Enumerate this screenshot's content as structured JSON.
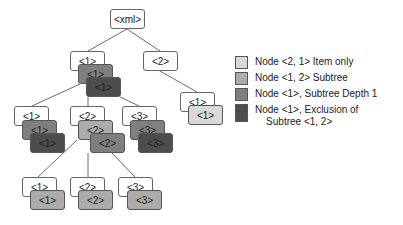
{
  "diagram": {
    "root": {
      "label": "<xml>"
    },
    "level1": [
      {
        "label": "<1>"
      },
      {
        "label": "<2>"
      }
    ],
    "level1_child1_overlays": [
      {
        "label": "<1>",
        "style": "Subtree Depth 1"
      },
      {
        "label": "<1>",
        "style": "Exclusion of Subtree <1, 2>"
      }
    ],
    "level2_under1": [
      {
        "label": "<1>"
      },
      {
        "label": "<2>"
      },
      {
        "label": "<3>"
      }
    ],
    "level2_under1_overlays": {
      "col1": [
        {
          "label": "<1>"
        },
        {
          "label": "<1>"
        }
      ],
      "col2": [
        {
          "label": "<2>"
        },
        {
          "label": "<2>"
        }
      ],
      "col3": [
        {
          "label": "<3>"
        },
        {
          "label": "<3>"
        }
      ]
    },
    "level2_under2": {
      "label": "<1>",
      "overlay_label": "<1>"
    },
    "level3": [
      {
        "label": "<1>",
        "overlay_label": "<1>"
      },
      {
        "label": "<2>",
        "overlay_label": "<2>"
      },
      {
        "label": "<3>",
        "overlay_label": "<3>"
      }
    ]
  },
  "legend": {
    "items": [
      {
        "label": "Node <2, 1> Item only",
        "color": "#d9d9d9"
      },
      {
        "label": "Node <1, 2> Subtree",
        "color": "#ababab"
      },
      {
        "label": "Node <1>, Subtree Depth 1",
        "color": "#7f7f7f"
      },
      {
        "label": "Node <1>, Exclusion of\n    Subtree <1, 2>",
        "color": "#4d4d4d"
      }
    ]
  }
}
